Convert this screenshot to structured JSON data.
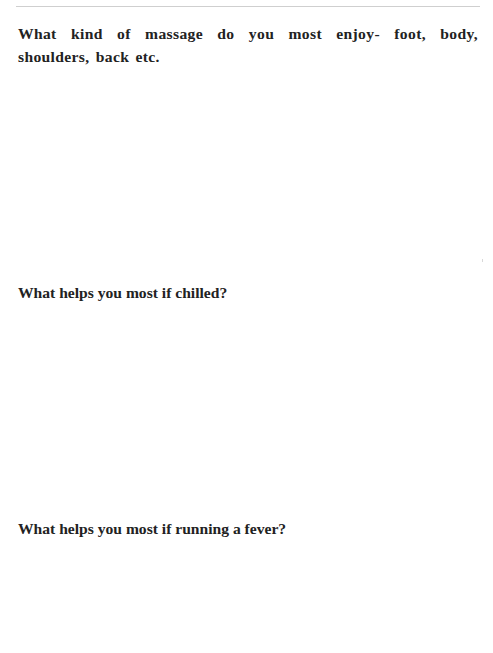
{
  "page": {
    "header_fragment": "…y … …g…,",
    "questions": [
      {
        "label": "What kind of massage do you most enjoy- foot, body, shoulders, back etc.",
        "answer": ""
      },
      {
        "label": "What helps you most if chilled?",
        "answer": ""
      },
      {
        "label": "What helps you most if running a fever?",
        "answer": ""
      }
    ]
  },
  "colors": {
    "text": "#222222",
    "rule": "#cfcfcf",
    "background": "#ffffff"
  }
}
